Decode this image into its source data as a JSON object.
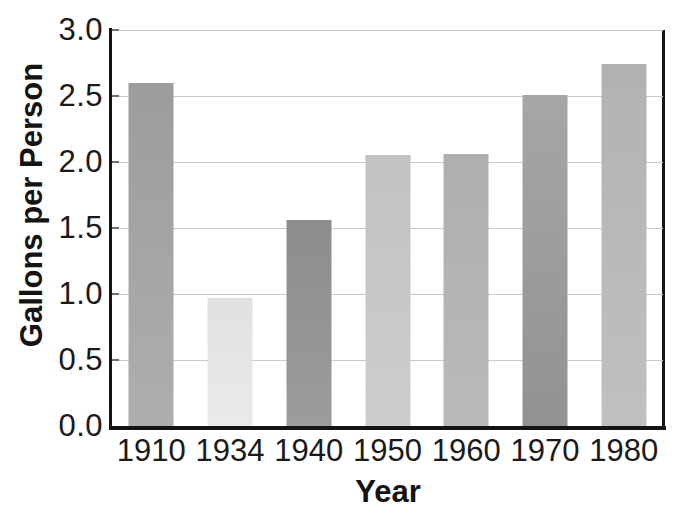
{
  "chart_data": {
    "type": "bar",
    "categories": [
      "1910",
      "1934",
      "1940",
      "1950",
      "1960",
      "1970",
      "1980"
    ],
    "values": [
      2.6,
      0.97,
      1.56,
      2.05,
      2.06,
      2.51,
      2.74
    ],
    "title": "",
    "xlabel": "Year",
    "ylabel": "Gallons per Person",
    "ylim": [
      0,
      3
    ],
    "ytick_step": 0.5,
    "ytick_labels": [
      "3.0",
      "2.5",
      "2.0",
      "1.5",
      "1.0",
      "0.5",
      "0.0"
    ],
    "grid": true,
    "legend": false,
    "bar_colors": [
      {
        "top": "#9c9c9c",
        "bottom": "#aeaeae"
      },
      {
        "top": "#e1e1e1",
        "bottom": "#eaeaea"
      },
      {
        "top": "#8d8d8d",
        "bottom": "#9c9c9c"
      },
      {
        "top": "#c2c2c2",
        "bottom": "#cdcdcd"
      },
      {
        "top": "#aeaeae",
        "bottom": "#bababa"
      },
      {
        "top": "#a6a6a6",
        "bottom": "#929292"
      },
      {
        "top": "#b2b2b2",
        "bottom": "#c0c0c0"
      }
    ],
    "gridline_color": "#c9c9c9",
    "axis_color": "#141414",
    "text_color": "#1a1a1a",
    "background_color": "#ffffff"
  }
}
